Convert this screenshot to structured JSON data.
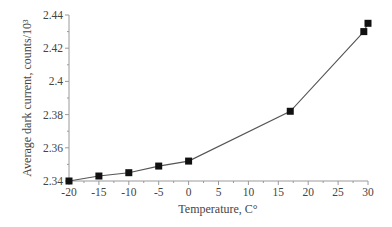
{
  "chart_data": {
    "type": "line",
    "title": "",
    "xlabel": "Temperature, C°",
    "ylabel": "Average dark current, counts/10³",
    "xlim": [
      -20,
      30
    ],
    "ylim": [
      2.34,
      2.44
    ],
    "x_ticks": [
      "-20",
      "-15",
      "-10",
      "-5",
      "0",
      "5",
      "10",
      "15",
      "20",
      "25",
      "30"
    ],
    "y_ticks": [
      "2.34",
      "2.36",
      "2.38",
      "2.4",
      "2.42",
      "2.44"
    ],
    "grid": false,
    "legend": null,
    "marker": "square",
    "series": [
      {
        "name": "Average dark current",
        "x": [
          -20,
          -15,
          -10,
          -5,
          0,
          17,
          29.3,
          30
        ],
        "values": [
          2.34,
          2.343,
          2.345,
          2.349,
          2.352,
          2.382,
          2.43,
          2.435
        ]
      }
    ],
    "colors": {
      "line": "#555555",
      "marker": "#111111",
      "axis": "#9a9a9a"
    }
  }
}
